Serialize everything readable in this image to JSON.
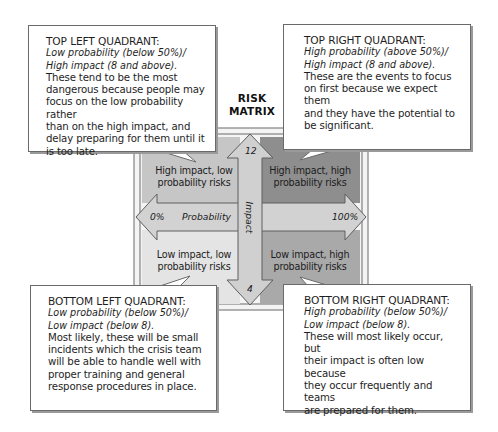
{
  "heading": {
    "line1": "RISK",
    "line2": "MATRIX"
  },
  "matrix": {
    "quadrants": {
      "top_left": {
        "label_line1": "High impact, low",
        "label_line2": "probability risks",
        "color": "#c6c6c6"
      },
      "top_right": {
        "label_line1": "High impact, high",
        "label_line2": "probability risks",
        "color": "#8e8e8e"
      },
      "bottom_left": {
        "label_line1": "Low impact, low",
        "label_line2": "probability risks",
        "color": "#e4e4e4"
      },
      "bottom_right": {
        "label_line1": "Low impact, high",
        "label_line2": "probability risks",
        "color": "#a9a9a9"
      }
    },
    "x_axis": {
      "name": "Probability",
      "min_label": "0%",
      "max_label": "100%"
    },
    "y_axis": {
      "name": "Impact",
      "max_label": "12",
      "min_label": "4"
    },
    "colors": {
      "arrow_fill": "#d2d2d2",
      "frame": "#f4f4f4",
      "outline": "#6b6b6b"
    }
  },
  "callouts": {
    "top_left": {
      "title": "TOP LEFT QUADRANT:",
      "sub1": "Low probability (below 50%)/",
      "sub2": "High impact (8 and above).",
      "body": [
        "These tend to be the most",
        "dangerous because people may",
        "focus on the low probability rather",
        "than on the high impact, and",
        "delay preparing for them until it",
        "is too late."
      ]
    },
    "top_right": {
      "title": "TOP RIGHT QUADRANT:",
      "sub1": "High probability (above 50%)/",
      "sub2": "High impact (8 and above).",
      "body": [
        "These are the events to focus",
        "on first because we expect them",
        "and they have the potential to",
        "be significant."
      ]
    },
    "bottom_left": {
      "title": "BOTTOM LEFT QUADRANT:",
      "sub1": "Low probability (below 50%)/",
      "sub2": "Low impact (below 8).",
      "body": [
        "Most likely, these will be small",
        "incidents which the crisis team",
        "will be able to handle well with",
        "proper training and general",
        "response procedures in place."
      ]
    },
    "bottom_right": {
      "title": "BOTTOM RIGHT QUADRANT:",
      "sub1": "High probability (below 50%)/",
      "sub2": "Low impact (below 8).",
      "body": [
        "These will most likely occur, but",
        "their impact is often low because",
        "they occur frequently and teams",
        "are prepared for them."
      ]
    }
  }
}
